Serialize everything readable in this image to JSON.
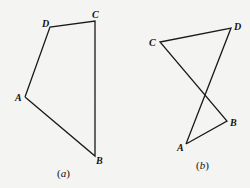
{
  "figures": [
    {
      "caption_open": "(",
      "caption_letter": "a",
      "caption_close": ")",
      "vertices": {
        "A": {
          "label": "A",
          "x": 25,
          "y": 97
        },
        "B": {
          "label": "B",
          "x": 95,
          "y": 156
        },
        "C": {
          "label": "C",
          "x": 95,
          "y": 21
        },
        "D": {
          "label": "D",
          "x": 50,
          "y": 27
        }
      },
      "description": "Convex quadrilateral ABCD"
    },
    {
      "caption_open": "(",
      "caption_letter": "b",
      "caption_close": ")",
      "vertices": {
        "A": {
          "label": "A",
          "x": 186,
          "y": 144
        },
        "B": {
          "label": "B",
          "x": 227,
          "y": 121
        },
        "C": {
          "label": "C",
          "x": 160,
          "y": 42
        },
        "D": {
          "label": "D",
          "x": 231,
          "y": 28
        }
      },
      "description": "Self-intersecting quadrilateral ABCD"
    }
  ]
}
